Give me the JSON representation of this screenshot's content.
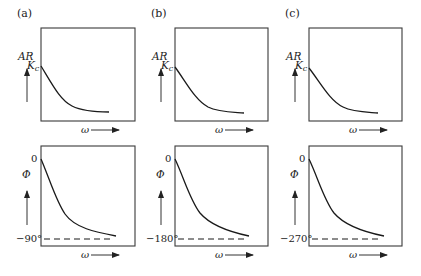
{
  "figure": {
    "panels": [
      {
        "tag": "(a)",
        "ar_label": "AR",
        "ar_start_label": "Kc",
        "ar_start_main": "K",
        "ar_start_sub": "c",
        "phase_label": "Φ",
        "phase_start": "0",
        "phase_asymptote": "−90°",
        "x_label": "ω"
      },
      {
        "tag": "(b)",
        "ar_label": "AR",
        "ar_start_label": "Kc",
        "ar_start_main": "K",
        "ar_start_sub": "c",
        "phase_label": "Φ",
        "phase_start": "0",
        "phase_asymptote": "−180°",
        "x_label": "ω"
      },
      {
        "tag": "(c)",
        "ar_label": "AR",
        "ar_start_label": "Kc",
        "ar_start_main": "K",
        "ar_start_sub": "c",
        "phase_label": "Φ",
        "phase_start": "0",
        "phase_asymptote": "−270°",
        "x_label": "ω"
      }
    ]
  },
  "colors": {
    "line": "#1a1a1a",
    "box": "#3a3a3a",
    "background": "#ffffff"
  }
}
